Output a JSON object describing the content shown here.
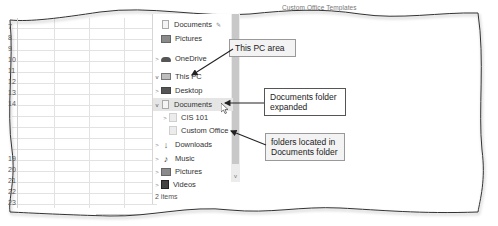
{
  "spreadsheet": {
    "row_numbers_top": [
      "7",
      "8",
      "9",
      "10",
      "11",
      "12",
      "13",
      "14"
    ],
    "row_numbers_bottom": [
      "19",
      "20",
      "21",
      "22",
      "23"
    ],
    "add_sheet_symbol": "+"
  },
  "top_fragment": "Custom Office Templates",
  "nav_pane": {
    "items": [
      {
        "label": "Documents",
        "icon": "document-icon",
        "chevron": "",
        "pinned": true,
        "pin_symbol": "✎"
      },
      {
        "label": "Pictures",
        "icon": "pictures-icon",
        "chevron": ""
      },
      {
        "label": "OneDrive",
        "icon": "cloud-icon",
        "chevron": ">"
      },
      {
        "label": "This PC",
        "icon": "computer-icon",
        "chevron": "v"
      },
      {
        "label": "Desktop",
        "icon": "desktop-icon",
        "chevron": ">"
      },
      {
        "label": "Documents",
        "icon": "document-icon",
        "chevron": "v",
        "selected": true
      },
      {
        "label": "CIS 101",
        "icon": "folder-icon",
        "chevron": ">"
      },
      {
        "label": "Custom Office",
        "icon": "folder-icon",
        "chevron": ""
      },
      {
        "label": "Downloads",
        "icon": "download-icon",
        "chevron": ">"
      },
      {
        "label": "Music",
        "icon": "music-icon",
        "chevron": ">"
      },
      {
        "label": "Pictures",
        "icon": "pictures-icon",
        "chevron": ">"
      },
      {
        "label": "Videos",
        "icon": "video-icon",
        "chevron": ">"
      }
    ],
    "scroll_down_symbol": "v",
    "status": "2 items"
  },
  "callouts": {
    "this_pc": "This PC area",
    "documents_expanded_line1": "Documents folder",
    "documents_expanded_line2": "expanded",
    "folders_located_line1": "folders located in",
    "folders_located_line2": "Documents folder"
  },
  "colors": {
    "callout_bg": "#f3f3f3",
    "selected_bg": "#e5e5e5",
    "frame": "#333333"
  }
}
